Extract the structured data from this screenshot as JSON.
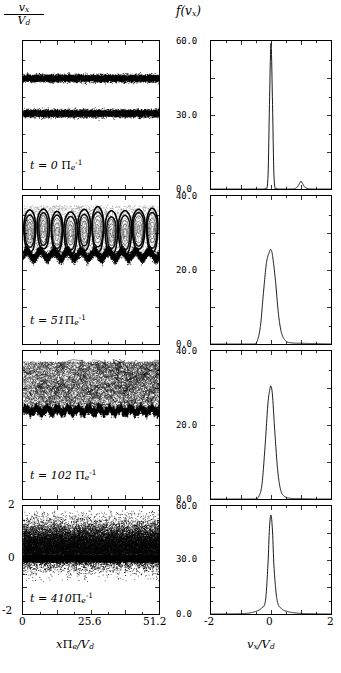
{
  "figure": {
    "left_column": {
      "axis_label_numerator": "v",
      "axis_label_numerator_sub": "x",
      "axis_label_denominator": "V",
      "axis_label_denominator_sub": "d",
      "xlabel_main": "x",
      "xlabel_pi": "Π",
      "xlabel_pi_sub": "e",
      "xlabel_tail": "/V",
      "xlabel_tail_sub": "d",
      "xticks": [
        "0",
        "25.6",
        "51.2"
      ],
      "yticks": [
        "-2",
        "0",
        "2"
      ],
      "xlim": [
        0,
        51.2
      ],
      "ylim": [
        -2,
        2
      ]
    },
    "right_column": {
      "axis_label": "f(v",
      "axis_label_sub": "x",
      "axis_label_close": ")",
      "xlabel_main": "v",
      "xlabel_main_sub": "x",
      "xlabel_tail": "/V",
      "xlabel_tail_sub": "d",
      "xticks": [
        "-2",
        "0",
        "2"
      ],
      "xlim": [
        -2,
        2
      ]
    },
    "rows": [
      {
        "time_prefix": "t = 0",
        "time_unit": "Π",
        "time_unit_sub": "e",
        "time_unit_sup": "-1",
        "dist_yticks": [
          "0.0",
          "30.0",
          "60.0"
        ],
        "dist_ylim": [
          0,
          60
        ]
      },
      {
        "time_prefix": "t = 51",
        "time_unit": "Π",
        "time_unit_sub": "e",
        "time_unit_sup": "-1",
        "dist_yticks": [
          "0.0",
          "20.0",
          "40.0"
        ],
        "dist_ylim": [
          0,
          40
        ]
      },
      {
        "time_prefix": "t = 102",
        "time_unit": "Π",
        "time_unit_sub": "e",
        "time_unit_sup": "-1",
        "dist_yticks": [
          "0.0",
          "20.0",
          "40.0"
        ],
        "dist_ylim": [
          0,
          40
        ]
      },
      {
        "time_prefix": "t = 410",
        "time_unit": "Π",
        "time_unit_sub": "e",
        "time_unit_sup": "-1",
        "dist_yticks": [
          "0.0",
          "30.0",
          "60.0"
        ],
        "dist_ylim": [
          0,
          60
        ]
      }
    ]
  },
  "chart_data": [
    {
      "type": "scatter",
      "title": "Electron phase space, t = 0 Πe^-1",
      "xlabel": "x Πe/Vd",
      "ylabel": "vx/Vd",
      "xlim": [
        0,
        51.2
      ],
      "ylim": [
        -2,
        2
      ],
      "grid": false,
      "annotation": "t = 0 Πe^-1",
      "description": "Two cold, spatially uniform counter-propagating electron beams appear as two narrow horizontal bands.",
      "beams": [
        {
          "center_v": 1.0,
          "half_width": 0.12,
          "density": "dense"
        },
        {
          "center_v": 0.05,
          "half_width": 0.12,
          "density": "dense"
        }
      ]
    },
    {
      "type": "line",
      "title": "Velocity distribution, t = 0 Πe^-1",
      "xlabel": "vx/Vd",
      "ylabel": "f(vx)",
      "xlim": [
        -2,
        2
      ],
      "ylim": [
        0,
        60
      ],
      "yticks": [
        0.0,
        30.0,
        60.0
      ],
      "grid": false,
      "series": [
        {
          "name": "f(vx)",
          "x": [
            -2.0,
            -1.0,
            -0.4,
            -0.2,
            -0.1,
            -0.05,
            0.0,
            0.05,
            0.1,
            0.2,
            0.4,
            0.7,
            0.85,
            0.95,
            1.0,
            1.05,
            1.15,
            1.4,
            2.0
          ],
          "values": [
            0.0,
            0.0,
            0.0,
            0.3,
            5.0,
            35.0,
            59.0,
            35.0,
            5.0,
            0.3,
            0.0,
            0.0,
            0.5,
            2.2,
            3.2,
            2.2,
            0.5,
            0.0,
            0.0
          ]
        }
      ],
      "notes": "Tall narrow peak at vx=0 reaching ~59; small secondary bump near vx=1 (second beam)."
    },
    {
      "type": "scatter",
      "title": "Electron phase space, t = 51 Πe^-1",
      "xlabel": "x Πe/Vd",
      "ylabel": "vx/Vd",
      "xlim": [
        0,
        51.2
      ],
      "ylim": [
        -2,
        2
      ],
      "grid": false,
      "annotation": "t = 51 Πe^-1",
      "description": "Two-stream instability has saturated: ~10 phase-space vortices (electron holes) with open trapping orbits between v=0.3 and v=1.7, sitting on a dense modulated band near v=0.4.",
      "vortex_count": 10,
      "vortex_v_range": [
        0.3,
        1.75
      ]
    },
    {
      "type": "line",
      "title": "Velocity distribution, t = 51 Πe^-1",
      "xlabel": "vx/Vd",
      "ylabel": "f(vx)",
      "xlim": [
        -2,
        2
      ],
      "ylim": [
        0,
        40
      ],
      "yticks": [
        0.0,
        20.0,
        40.0
      ],
      "grid": false,
      "series": [
        {
          "name": "f(vx)",
          "x": [
            -2.0,
            -1.0,
            -0.55,
            -0.45,
            -0.35,
            -0.25,
            -0.15,
            -0.05,
            0.0,
            0.05,
            0.15,
            0.25,
            0.35,
            0.5,
            0.7,
            1.0,
            1.5,
            2.0
          ],
          "values": [
            0.0,
            0.0,
            0.0,
            1.0,
            5.0,
            14.0,
            22.0,
            25.0,
            25.5,
            24.0,
            17.0,
            8.0,
            3.0,
            0.8,
            0.3,
            0.2,
            0.1,
            0.0
          ]
        }
      ],
      "notes": "Broadened single peak, maximum ~25.5 at vx~0."
    },
    {
      "type": "scatter",
      "title": "Electron phase space, t = 102 Πe^-1",
      "xlabel": "x Πe/Vd",
      "ylabel": "vx/Vd",
      "xlim": [
        0,
        51.2
      ],
      "ylim": [
        -2,
        2
      ],
      "grid": false,
      "annotation": "t = 102 Πe^-1",
      "description": "Vortices have merged and become turbulent; filamented, frothy structure spanning v=0.3 to 1.7 above a dense corrugated band near v=0.35.",
      "turbulent_v_range": [
        0.3,
        1.7
      ]
    },
    {
      "type": "line",
      "title": "Velocity distribution, t = 102 Πe^-1",
      "xlabel": "vx/Vd",
      "ylabel": "f(vx)",
      "xlim": [
        -2,
        2
      ],
      "ylim": [
        0,
        40
      ],
      "yticks": [
        0.0,
        20.0,
        40.0
      ],
      "grid": false,
      "series": [
        {
          "name": "f(vx)",
          "x": [
            -2.0,
            -1.0,
            -0.5,
            -0.4,
            -0.3,
            -0.2,
            -0.1,
            -0.03,
            0.0,
            0.05,
            0.12,
            0.22,
            0.32,
            0.45,
            0.65,
            1.0,
            1.5,
            2.0
          ],
          "values": [
            0.0,
            0.0,
            0.0,
            0.8,
            4.0,
            14.0,
            26.0,
            30.0,
            30.5,
            28.0,
            19.0,
            8.0,
            2.5,
            0.7,
            0.2,
            0.1,
            0.0,
            0.0
          ]
        }
      ],
      "notes": "Peak ~30.5 at vx~0, slightly narrower than t=51."
    },
    {
      "type": "scatter",
      "title": "Electron phase space, t = 410 Πe^-1",
      "xlabel": "x Πe/Vd",
      "ylabel": "vx/Vd",
      "xlim": [
        0,
        51.2
      ],
      "ylim": [
        -2,
        2
      ],
      "grid": false,
      "annotation": "t = 410 Πe^-1",
      "description": "Fully relaxed, spatially uniform hot plasma: diffuse speckled cloud from v~-0.7 to 1.8 with a very dense saturated black band at v~0 to 0.15.",
      "cloud_v_range": [
        -0.7,
        1.8
      ],
      "dense_band_v": [
        0.0,
        0.15
      ]
    },
    {
      "type": "line",
      "title": "Velocity distribution, t = 410 Πe^-1",
      "xlabel": "vx/Vd",
      "ylabel": "f(vx)",
      "xlim": [
        -2,
        2
      ],
      "ylim": [
        0,
        60
      ],
      "yticks": [
        0.0,
        30.0,
        60.0
      ],
      "grid": false,
      "series": [
        {
          "name": "f(vx)",
          "x": [
            -2.0,
            -1.2,
            -0.8,
            -0.5,
            -0.3,
            -0.18,
            -0.1,
            -0.05,
            0.0,
            0.05,
            0.1,
            0.2,
            0.35,
            0.55,
            0.8,
            1.1,
            1.5,
            2.0
          ],
          "values": [
            0.0,
            0.1,
            0.4,
            1.5,
            3.5,
            8.0,
            28.0,
            48.0,
            55.0,
            46.0,
            26.0,
            8.0,
            3.0,
            1.4,
            0.6,
            0.25,
            0.1,
            0.0
          ]
        }
      ],
      "notes": "Sharp narrow peak ~55 at vx=0 with broad low-level tails on both sides."
    }
  ]
}
